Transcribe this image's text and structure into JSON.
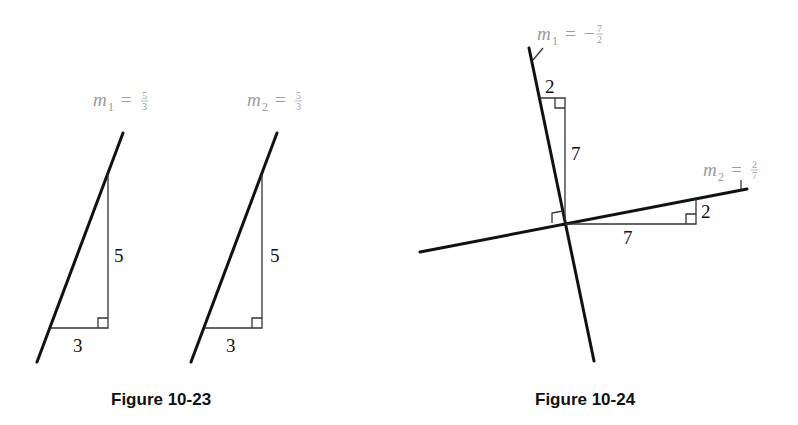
{
  "figures": [
    {
      "caption": "Figure 10-23",
      "description": "Two parallel lines with equal slopes",
      "lines": [
        {
          "slope_label": {
            "var": "m",
            "sub": "1",
            "eq": "=",
            "sign": "",
            "num": "5",
            "den": "3"
          },
          "rise_label": "5",
          "run_label": "3"
        },
        {
          "slope_label": {
            "var": "m",
            "sub": "2",
            "eq": "=",
            "sign": "",
            "num": "5",
            "den": "3"
          },
          "rise_label": "5",
          "run_label": "3"
        }
      ]
    },
    {
      "caption": "Figure 10-24",
      "description": "Two perpendicular lines with negative reciprocal slopes",
      "lines": [
        {
          "slope_label": {
            "var": "m",
            "sub": "1",
            "eq": "=",
            "sign": "−",
            "num": "7",
            "den": "2"
          },
          "rise_label": "7",
          "run_label": "2"
        },
        {
          "slope_label": {
            "var": "m",
            "sub": "2",
            "eq": "=",
            "sign": "",
            "num": "2",
            "den": "7"
          },
          "rise_label": "2",
          "run_label": "7"
        }
      ]
    }
  ],
  "colors": {
    "line": "#111111",
    "label_gray": "#9a9a9a",
    "background": "#ffffff"
  }
}
